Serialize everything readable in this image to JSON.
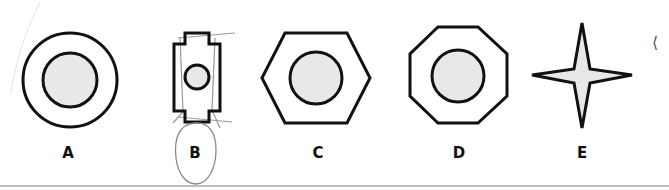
{
  "figure": {
    "shapes": [
      {
        "id": "A",
        "label": "A",
        "outer": "circle",
        "inner": "circle"
      },
      {
        "id": "B",
        "label": "B",
        "outer": "notched-rectangle",
        "inner": "circle",
        "annotated": "hand-drawn-circle"
      },
      {
        "id": "C",
        "label": "C",
        "outer": "hexagon",
        "inner": "circle"
      },
      {
        "id": "D",
        "label": "D",
        "outer": "octagon",
        "inner": "circle"
      },
      {
        "id": "E",
        "label": "E",
        "outer": "four-pointed-star",
        "inner": "none"
      }
    ],
    "colors": {
      "stroke": "#111111",
      "fill_inner": "#e8e8e8",
      "annotation": "#888888",
      "baseline": "#aaaaaa"
    },
    "edge_mark": "⟨"
  }
}
